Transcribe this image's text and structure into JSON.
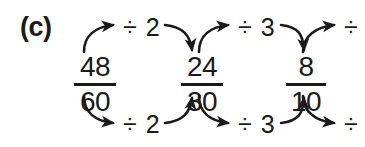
{
  "figure": {
    "part_label": "(c)",
    "type": "fraction-simplification-chain",
    "background_color": "#ffffff",
    "ink_color": "#1a1a1a"
  },
  "fractions": [
    {
      "numerator": "48",
      "denominator": "60"
    },
    {
      "numerator": "24",
      "denominator": "30"
    },
    {
      "numerator": "8",
      "denominator": "10"
    }
  ],
  "operations": {
    "top": [
      {
        "label": "÷ 2"
      },
      {
        "label": "÷ 3"
      },
      {
        "label": "÷"
      }
    ],
    "bottom": [
      {
        "label": "÷ 2"
      },
      {
        "label": "÷ 3"
      },
      {
        "label": "÷"
      }
    ]
  },
  "arrows": {
    "count": 12,
    "description": "curved arrows from each fraction up to the operation label and down from the label into the next fraction, mirrored below"
  }
}
